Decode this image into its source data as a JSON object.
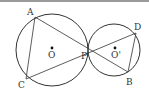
{
  "figure": {
    "type": "geometry",
    "colors": {
      "stroke": "#333333",
      "topbar": "#9a9a9a",
      "background": "#ffffff"
    },
    "circles": [
      {
        "name": "O",
        "cx": 52,
        "cy": 50,
        "r": 36
      },
      {
        "name": "O'",
        "cx": 114,
        "cy": 50,
        "r": 26
      }
    ],
    "points": {
      "A": {
        "x": 35,
        "y": 17,
        "label": "A",
        "lx": 27,
        "ly": 15
      },
      "C": {
        "x": 26,
        "y": 79,
        "label": "C",
        "lx": 18,
        "ly": 88
      },
      "P": {
        "x": 88,
        "y": 48,
        "label": "P",
        "lx": 81,
        "ly": 59
      },
      "D": {
        "x": 136,
        "y": 33,
        "label": "D",
        "lx": 134,
        "ly": 30
      },
      "B": {
        "x": 128,
        "y": 72,
        "label": "B",
        "lx": 126,
        "ly": 85
      }
    },
    "centers": {
      "O": {
        "x": 52,
        "y": 48,
        "label": "O",
        "lx": 48,
        "ly": 58
      },
      "O_prime": {
        "x": 115,
        "y": 48,
        "label": "O'",
        "lx": 111,
        "ly": 58
      }
    },
    "segments": [
      [
        "A",
        "C"
      ],
      [
        "A",
        "B"
      ],
      [
        "C",
        "D"
      ],
      [
        "D",
        "B"
      ]
    ]
  }
}
